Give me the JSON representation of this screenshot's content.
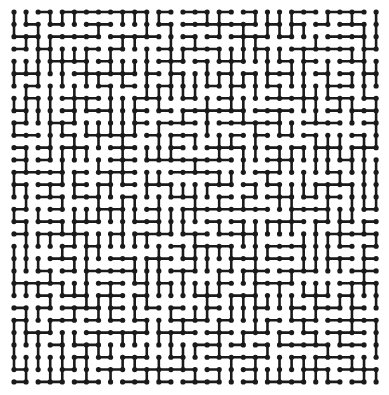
{
  "maze": {
    "cols": 31,
    "rows": 31,
    "origin_x": 14,
    "origin_y": 12,
    "step_x": 12.07,
    "step_y": 12.33,
    "line_color": "#1a1a1a",
    "line_width": 2.6,
    "dot_radius": 2.6,
    "seed": 73421
  }
}
